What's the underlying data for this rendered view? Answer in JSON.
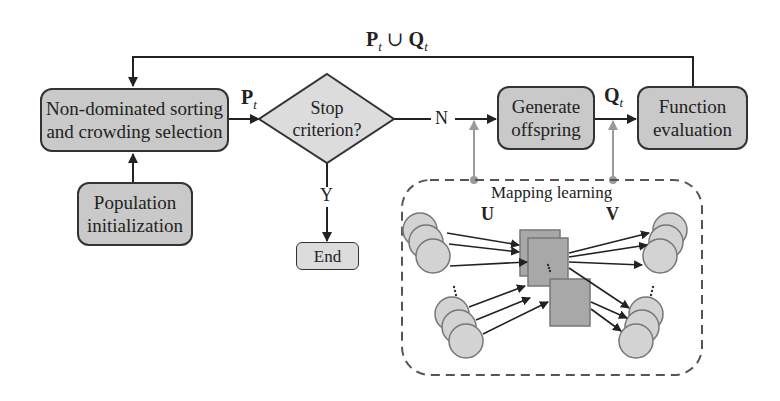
{
  "diagram": {
    "feedback_label": {
      "P": "P",
      "sub1": "t",
      "union": " ∪ ",
      "Q": "Q",
      "sub2": "t"
    },
    "nodes": {
      "selection": {
        "line1": "Non-dominated sorting",
        "line2": "and crowding selection"
      },
      "stop": {
        "line1": "Stop",
        "line2": "criterion?"
      },
      "generate": {
        "line1": "Generate",
        "line2": "offspring"
      },
      "evaluation": {
        "line1": "Function",
        "line2": "evaluation"
      },
      "init": {
        "line1": "Population",
        "line2": "initialization"
      },
      "end": {
        "label": "End"
      }
    },
    "edge_labels": {
      "pt": {
        "P": "P",
        "sub": "t"
      },
      "qt": {
        "Q": "Q",
        "sub": "t"
      },
      "no": "N",
      "yes": "Y"
    },
    "mapping": {
      "title": "Mapping learning",
      "U": "U",
      "V": "V"
    },
    "colors": {
      "box_fill": "#c9c9c9",
      "end_fill": "#dcdcdc",
      "diamond_fill": "#dcdcdc",
      "stroke": "#333333",
      "gray_arrow": "#9a9a9a",
      "node_fill": "#d3d3d3",
      "square_fill": "#a8a8a8",
      "dashed": "#555555"
    }
  }
}
